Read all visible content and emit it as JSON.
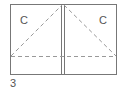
{
  "figure": {
    "number_label": "3",
    "panels": [
      {
        "label": "C",
        "side": "left"
      },
      {
        "label": "C",
        "side": "right"
      }
    ],
    "colors": {
      "line": "#777777",
      "dash": "#999999",
      "text": "#555555"
    }
  }
}
